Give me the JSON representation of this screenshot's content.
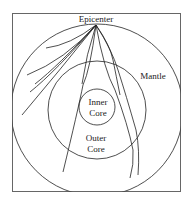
{
  "diagram": {
    "title_label": "Epicenter",
    "labels": {
      "epicenter": "Epicenter",
      "mantle": "Mantle",
      "inner_core_line1": "Inner",
      "inner_core_line2": "Core",
      "outer_core_line1": "Outer",
      "outer_core_line2": "Core"
    },
    "line_color": "#222222",
    "frame_color": "#666666"
  }
}
